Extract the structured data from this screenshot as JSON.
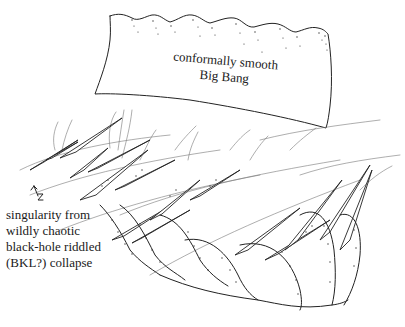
{
  "figure": {
    "banner": {
      "line1": "conformally smooth",
      "line2": "Big Bang"
    },
    "annotation": {
      "marker_glyph": "arrow-z-mark",
      "lines": [
        "singularity from",
        "wildly chaotic",
        "black-hole riddled",
        "(BKL?) collapse"
      ]
    },
    "colors": {
      "ink": "#222222",
      "background": "#ffffff"
    }
  }
}
